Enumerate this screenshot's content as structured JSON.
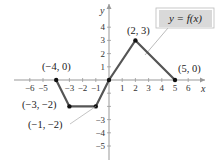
{
  "chart_data": {
    "type": "line",
    "title": "",
    "xlabel": "x",
    "ylabel": "y",
    "xlim": [
      -6.5,
      7
    ],
    "ylim": [
      -5.5,
      5
    ],
    "grid": false,
    "x_ticks": [
      -6,
      -5,
      -3,
      -2,
      -1,
      1,
      2,
      3,
      4,
      5,
      6
    ],
    "x_tick_labels": [
      "−6",
      "−5",
      "−3",
      "−2",
      "−1",
      "1",
      "2",
      "3",
      "4",
      "5",
      "6"
    ],
    "y_ticks": [
      4,
      3,
      2,
      1,
      -3,
      -4,
      -5
    ],
    "y_tick_labels": [
      "4",
      "3",
      "2",
      "1",
      "−3",
      "−4",
      "−5"
    ],
    "series": [
      {
        "name": "y = f(x)",
        "points": [
          {
            "x": -4,
            "y": 0
          },
          {
            "x": -3,
            "y": -2
          },
          {
            "x": -1,
            "y": -2
          },
          {
            "x": 0,
            "y": 0
          },
          {
            "x": 2,
            "y": 3
          },
          {
            "x": 5,
            "y": 0
          }
        ]
      }
    ],
    "annotations": [
      {
        "text": "(−4, 0)",
        "x": -4,
        "y": 0
      },
      {
        "text": "(−3, −2)",
        "x": -3,
        "y": -2
      },
      {
        "text": "(−1, −2)",
        "x": -1,
        "y": -2
      },
      {
        "text": "(2, 3)",
        "x": 2,
        "y": 3
      },
      {
        "text": "(5, 0)",
        "x": 5,
        "y": 0
      }
    ],
    "legend": {
      "text": "y = f(x)",
      "position": "top-right"
    }
  },
  "colors": {
    "line": "#555555",
    "axis": "#999999",
    "point": "#111111",
    "legend_bg": "#d9d9d9",
    "legend_border": "#bbbbbb"
  }
}
